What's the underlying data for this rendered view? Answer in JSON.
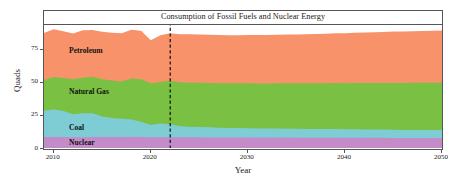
{
  "chart_data": {
    "type": "area",
    "stacked": true,
    "title": "Consumption of Fossil Fuels and Nuclear Energy",
    "xlabel": "Year",
    "ylabel": "Quads",
    "xlim": [
      2009,
      2050
    ],
    "ylim": [
      0,
      93
    ],
    "grid": false,
    "legend": "in-plot series labels",
    "xticks": [
      "2010",
      "2020",
      "2030",
      "2040",
      "2050"
    ],
    "xtick_values": [
      2010,
      2020,
      2030,
      2040,
      2050
    ],
    "yticks": [
      "0",
      "25",
      "50",
      "75"
    ],
    "ytick_values": [
      0,
      25,
      50,
      75
    ],
    "x": [
      2009,
      2010,
      2011,
      2012,
      2013,
      2014,
      2015,
      2016,
      2017,
      2018,
      2019,
      2020,
      2021,
      2022,
      2023,
      2024,
      2025,
      2026,
      2027,
      2028,
      2029,
      2030,
      2031,
      2032,
      2033,
      2034,
      2035,
      2036,
      2037,
      2038,
      2039,
      2040,
      2041,
      2042,
      2043,
      2044,
      2045,
      2046,
      2047,
      2048,
      2049,
      2050
    ],
    "series": [
      {
        "name": "Nuclear",
        "color": "#C48BC9",
        "order": 1,
        "values": [
          8.4,
          8.4,
          8.3,
          8.1,
          8.2,
          8.3,
          8.3,
          8.4,
          8.4,
          8.4,
          8.5,
          8.2,
          8.1,
          8.1,
          8.1,
          8.1,
          8.1,
          8.0,
          8.0,
          8.0,
          8.0,
          8.0,
          7.9,
          7.9,
          7.9,
          7.9,
          7.8,
          7.8,
          7.8,
          7.8,
          7.8,
          7.7,
          7.7,
          7.7,
          7.7,
          7.7,
          7.6,
          7.6,
          7.6,
          7.6,
          7.6,
          7.6
        ]
      },
      {
        "name": "Coal",
        "color": "#7FCDD4",
        "order": 2,
        "values": [
          19.7,
          20.8,
          19.7,
          17.4,
          18.0,
          18.0,
          15.5,
          14.2,
          13.8,
          13.2,
          11.3,
          9.2,
          10.5,
          9.8,
          8.4,
          8.0,
          7.8,
          7.6,
          7.4,
          7.2,
          7.1,
          7.0,
          6.9,
          6.8,
          6.8,
          6.7,
          6.7,
          6.6,
          6.6,
          6.5,
          6.5,
          6.4,
          6.4,
          6.3,
          6.3,
          6.2,
          6.2,
          6.1,
          6.1,
          6.0,
          6.0,
          6.0
        ]
      },
      {
        "name": "Natural Gas",
        "color": "#7AC143",
        "order": 3,
        "values": [
          23.3,
          24.5,
          25.0,
          26.4,
          26.9,
          27.6,
          28.2,
          28.4,
          28.0,
          30.9,
          32.1,
          31.5,
          31.3,
          33.0,
          33.2,
          33.3,
          33.4,
          33.5,
          33.6,
          33.7,
          33.8,
          33.9,
          34.0,
          34.1,
          34.2,
          34.3,
          34.4,
          34.5,
          34.6,
          34.7,
          34.8,
          34.9,
          35.0,
          35.1,
          35.2,
          35.3,
          35.4,
          35.5,
          35.6,
          35.7,
          35.8,
          35.9
        ]
      },
      {
        "name": "Petroleum",
        "color": "#F7926B",
        "order": 4,
        "values": [
          35.6,
          36.1,
          35.3,
          34.7,
          35.9,
          35.4,
          35.9,
          36.2,
          36.6,
          37.0,
          36.7,
          32.5,
          35.3,
          35.8,
          36.4,
          36.6,
          36.6,
          36.5,
          36.5,
          36.4,
          36.4,
          36.5,
          36.6,
          36.7,
          36.8,
          36.9,
          37.0,
          37.1,
          37.2,
          37.4,
          37.6,
          37.8,
          38.0,
          38.2,
          38.4,
          38.6,
          38.8,
          38.9,
          39.0,
          39.1,
          39.2,
          39.3
        ]
      }
    ],
    "totals": [
      87.0,
      89.8,
      88.3,
      86.6,
      89.0,
      89.3,
      87.9,
      87.2,
      86.8,
      89.5,
      88.6,
      81.4,
      85.2,
      86.7,
      86.1,
      86.0,
      85.9,
      85.6,
      85.5,
      85.3,
      85.3,
      85.4,
      85.4,
      85.5,
      85.7,
      85.8,
      85.9,
      86.0,
      86.2,
      86.4,
      86.7,
      86.8,
      87.1,
      87.3,
      87.6,
      87.8,
      88.0,
      88.1,
      88.3,
      88.4,
      88.6,
      88.8
    ],
    "annotations": [
      {
        "name": "projection-divider",
        "type": "vline",
        "x_value": 2022,
        "style": "dashed",
        "color": "#000000"
      }
    ]
  }
}
